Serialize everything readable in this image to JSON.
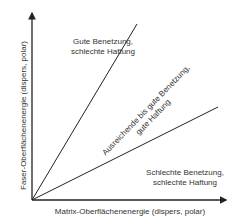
{
  "diagram": {
    "x_axis_label": "Matrix-Oberflächenenergie (dispers, polar)",
    "y_axis_label": "Faser-Oberflächenenergie (dispers, polar)",
    "regions": [
      {
        "line1": "Gute Benetzung,",
        "line2": "schlechte Haftung"
      },
      {
        "line1": "Ausreichende bis gute Benetzung,",
        "line2": "gute Haftung"
      },
      {
        "line1": "Schlechte Benetzung,",
        "line2": "schlechte Haftung"
      }
    ],
    "colors": {
      "axis": "#222222",
      "line": "#222222",
      "text": "#333333"
    }
  }
}
